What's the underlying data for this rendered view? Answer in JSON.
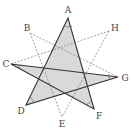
{
  "diagram": {
    "type": "star-geometry",
    "points": {
      "A": {
        "label": "A",
        "x": 68,
        "y": 18,
        "lx": 68,
        "ly": 13
      },
      "B": {
        "label": "B",
        "x": 30,
        "y": 33,
        "lx": 27,
        "ly": 31
      },
      "C": {
        "label": "C",
        "x": 11,
        "y": 64,
        "lx": 6,
        "ly": 67
      },
      "D": {
        "label": "D",
        "x": 26,
        "y": 105,
        "lx": 21,
        "ly": 114
      },
      "E": {
        "label": "E",
        "x": 62,
        "y": 117,
        "lx": 62,
        "ly": 127
      },
      "F": {
        "label": "F",
        "x": 94,
        "y": 109,
        "lx": 99,
        "ly": 119
      },
      "G": {
        "label": "G",
        "x": 118,
        "y": 77,
        "lx": 125,
        "ly": 81
      },
      "H": {
        "label": "H",
        "x": 109,
        "y": 31,
        "lx": 115,
        "ly": 31
      }
    },
    "solid_star": [
      "A",
      "D",
      "G",
      "C",
      "F"
    ],
    "dashed_segments": [
      [
        "B",
        "G"
      ],
      [
        "C",
        "H"
      ],
      [
        "H",
        "E"
      ],
      [
        "B",
        "E"
      ]
    ],
    "colors": {
      "fill": "#d9d9d9",
      "line": "#333333",
      "dashed": "#777777",
      "label": "#444444"
    }
  }
}
